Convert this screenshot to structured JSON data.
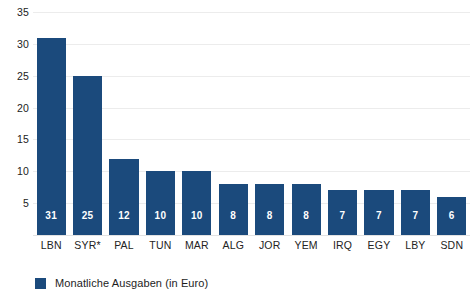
{
  "chart_data": {
    "type": "bar",
    "title": "",
    "subtitle": "",
    "xlabel": "",
    "ylabel": "",
    "ylim": [
      0,
      35
    ],
    "yticks": [
      5,
      10,
      15,
      20,
      25,
      30,
      35
    ],
    "ytick_labels": [
      "5",
      "10",
      "15",
      "20",
      "25",
      "30",
      "35"
    ],
    "grid": true,
    "legend_position": "bottom-left",
    "categories": [
      "LBN",
      "SYR*",
      "PAL",
      "TUN",
      "MAR",
      "ALG",
      "JOR",
      "YEM",
      "IRQ",
      "EGY",
      "LBY",
      "SDN"
    ],
    "series": [
      {
        "name": "Monatliche Ausgaben (in Euro)",
        "color": "#1b4a7c",
        "values": [
          31,
          25,
          12,
          10,
          10,
          8,
          8,
          8,
          7,
          7,
          7,
          6
        ],
        "value_labels": [
          "31",
          "25",
          "12",
          "10",
          "10",
          "8",
          "8",
          "8",
          "7",
          "7",
          "7",
          "6"
        ]
      }
    ],
    "legend": [
      {
        "label": "Monatliche Ausgaben (in Euro)",
        "color": "#1b4a7c"
      }
    ],
    "annotations": []
  },
  "colors": {
    "bar": "#1b4a7c",
    "gridline": "#ececec",
    "baseline": "#e2e2e2",
    "axis_text": "#222222",
    "value_label": "#ffffff",
    "background": "#ffffff"
  }
}
